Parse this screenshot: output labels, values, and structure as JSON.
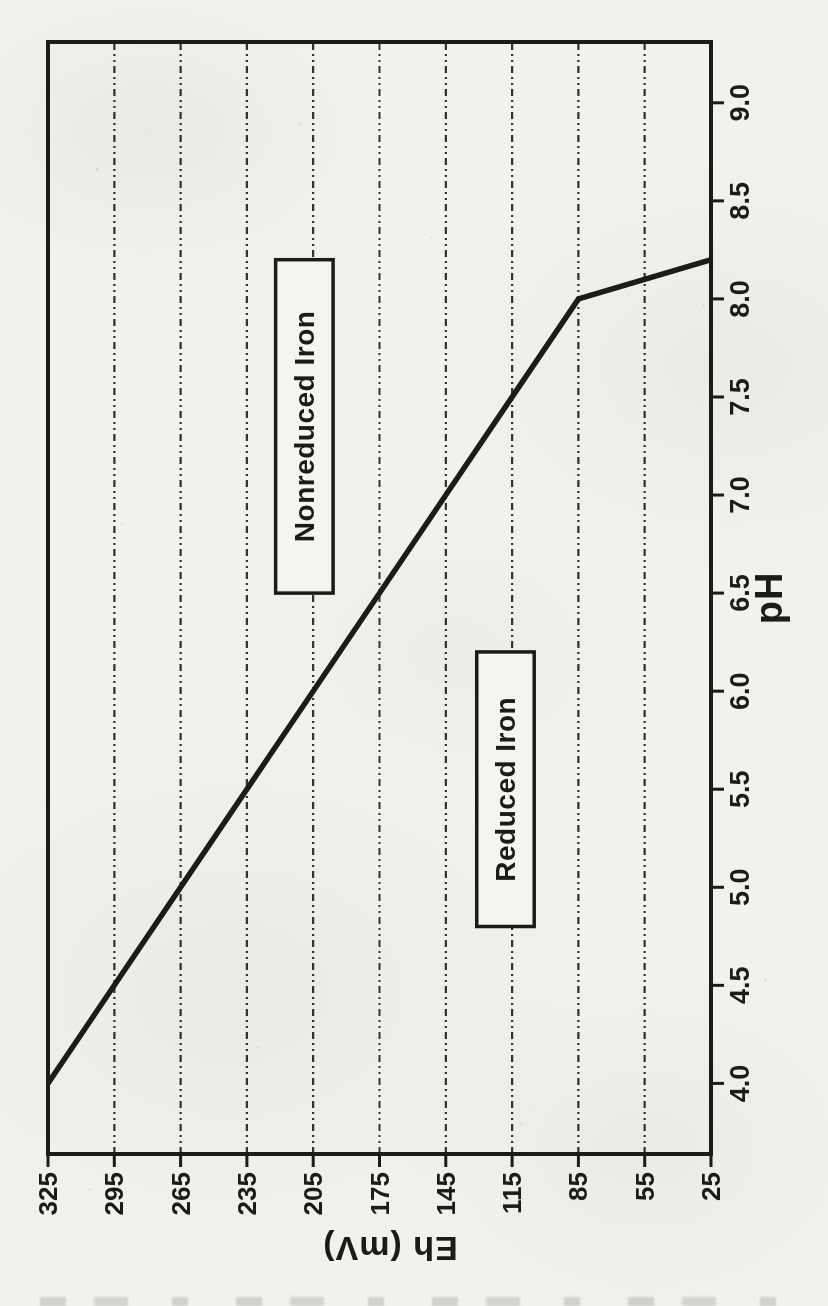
{
  "figure": {
    "kind": "scanned-rotated-line-chart",
    "ink_color": "#1c1b18",
    "paper_color": "#f2f1ed"
  },
  "chart_data": {
    "type": "line",
    "title": "",
    "xlabel": "pH",
    "ylabel": "Eh (mV)",
    "xlim": [
      3.64,
      9.31
    ],
    "ylim": [
      25,
      325
    ],
    "x_ticks": [
      4.0,
      4.5,
      5.0,
      5.5,
      6.0,
      6.5,
      7.0,
      7.5,
      8.0,
      8.5,
      9.0
    ],
    "x_tick_labels": [
      "4.0",
      "4.5",
      "5.0",
      "5.5",
      "6.0",
      "6.5",
      "7.0",
      "7.5",
      "8.0",
      "8.5",
      "9.0"
    ],
    "y_ticks": [
      25,
      55,
      85,
      115,
      145,
      175,
      205,
      235,
      265,
      295,
      325
    ],
    "y_tick_labels": [
      "25",
      "55",
      "85",
      "115",
      "145",
      "175",
      "205",
      "235",
      "265",
      "295",
      "325"
    ],
    "grid": {
      "horizontal": true,
      "vertical": false,
      "style": "dash-dot"
    },
    "legend": "none",
    "series": [
      {
        "name": "redox-boundary-line",
        "points": [
          [
            4.0,
            325
          ],
          [
            8.0,
            85
          ],
          [
            8.2,
            25
          ]
        ]
      }
    ],
    "annotations": [
      {
        "label": "Nonreduced Iron",
        "ph_range": [
          6.5,
          8.2
        ],
        "eh_range": [
          196,
          222
        ]
      },
      {
        "label": "Reduced Iron",
        "ph_range": [
          4.8,
          6.2
        ],
        "eh_range": [
          105,
          131
        ]
      }
    ]
  }
}
